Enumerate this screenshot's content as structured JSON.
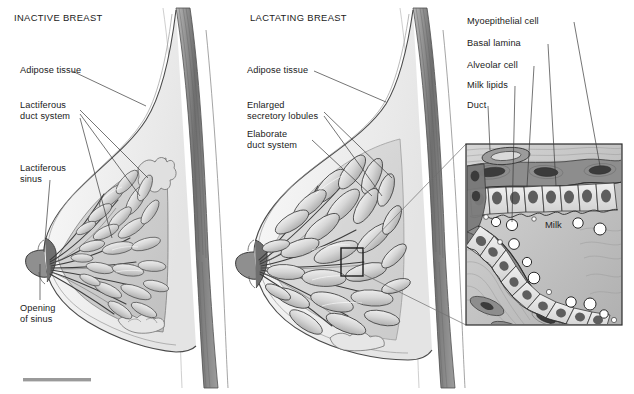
{
  "figure": {
    "panels": [
      {
        "id": "inactive",
        "title": "INACTIVE BREAST"
      },
      {
        "id": "lactating",
        "title": "LACTATING BREAST"
      }
    ],
    "labels_left": [
      {
        "name": "adipose-tissue",
        "text": "Adipose tissue"
      },
      {
        "name": "lactiferous-duct-system",
        "text": "Lactiferous\nduct system"
      },
      {
        "name": "lactiferous-sinus",
        "text": "Lactiferous\nsinus"
      },
      {
        "name": "opening-of-sinus",
        "text": "Opening\nof sinus"
      }
    ],
    "labels_middle": [
      {
        "name": "adipose-tissue",
        "text": "Adipose tissue"
      },
      {
        "name": "enlarged-secretory-lobules",
        "text": "Enlarged\nsecretory lobules"
      },
      {
        "name": "elaborate-duct-system",
        "text": "Elaborate\nduct system"
      }
    ],
    "labels_inset": [
      {
        "name": "myoepithelial-cell",
        "text": "Myoepithelial cell"
      },
      {
        "name": "basal-lamina",
        "text": "Basal lamina"
      },
      {
        "name": "alveolar-cell",
        "text": "Alveolar cell"
      },
      {
        "name": "milk-lipids",
        "text": "Milk lipids"
      },
      {
        "name": "duct",
        "text": "Duct"
      }
    ],
    "inset": {
      "lumen_label": "Milk"
    },
    "scale_bar": {
      "label": ""
    },
    "colors": {
      "ink": "#1a1a1a",
      "leader": "#555555",
      "muscle": "#8a8a8a",
      "muscle_dark": "#6e6e6e",
      "skin_fill": "#f4f4f4",
      "fat_fill": "#ededed",
      "gland_fill": "#cfcfcf",
      "lobule_light": "#e8e8e8",
      "lobule_mid": "#c9c9c9",
      "duct_dark": "#4a4a4a",
      "inset_bg": "#f2f2f2",
      "cell_fill": "#e3e3e3",
      "nucleus": "#4d4d4d",
      "stroma": "#bdbdbd",
      "scale_bar": "#9a9a9a"
    }
  }
}
